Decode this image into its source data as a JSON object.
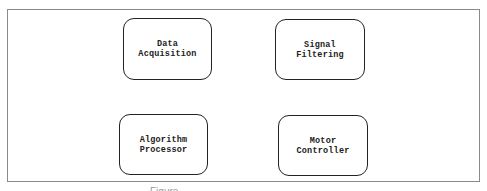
{
  "diagram": {
    "nodes": [
      {
        "id": "data-acquisition",
        "lines": [
          "Data",
          "Acquisition"
        ]
      },
      {
        "id": "signal-filtering",
        "lines": [
          "Signal",
          "Filtering"
        ]
      },
      {
        "id": "algorithm-processor",
        "lines": [
          "Algorithm",
          "Processor"
        ]
      },
      {
        "id": "motor-controller",
        "lines": [
          "Motor",
          "Controller"
        ]
      }
    ],
    "caption": "Figure"
  },
  "colors": {
    "node_border": "#222222",
    "frame_border": "#8a8a8a",
    "text": "#222222",
    "background": "#ffffff"
  }
}
